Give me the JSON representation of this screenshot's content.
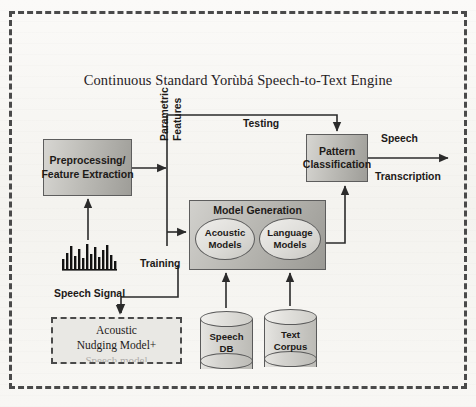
{
  "diagram": {
    "title": "Continuous Standard Yorùbá Speech-to-Text Engine",
    "boxes": {
      "preprocessing": {
        "line1": "Preprocessing/",
        "line2": "Feature Extraction"
      },
      "pattern_classification": {
        "line1": "Pattern",
        "line2": "Classification"
      },
      "model_generation": {
        "title": "Model Generation"
      },
      "acoustic_models": {
        "line1": "Acoustic",
        "line2": "Models"
      },
      "language_models": {
        "line1": "Language",
        "line2": "Models"
      },
      "acoustic_nudging": {
        "line1": "Acoustic",
        "line2": "Nudging Model+",
        "line3": "Speech model"
      }
    },
    "datastores": {
      "speech_db": {
        "line1": "Speech",
        "line2": "DB"
      },
      "text_corpus": {
        "line1": "Text",
        "line2": "Corpus"
      }
    },
    "labels": {
      "parametric_features_line1": "Parametric",
      "parametric_features_line2": "Features",
      "testing": "Testing",
      "training": "Training",
      "speech_output": "Speech",
      "transcription_output": "Transcription",
      "speech_signal": "Speech Signal"
    },
    "icons": {
      "waveform": "audio-waveform-icon"
    },
    "colors": {
      "border": "#4a4a4a",
      "box_fill_dark": "#9e9d98",
      "box_fill_light": "#d7d6d2",
      "text": "#1d1a18",
      "background": "#f7f6f3"
    }
  }
}
